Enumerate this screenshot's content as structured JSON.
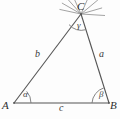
{
  "figure": {
    "kind": "geometry-diagram",
    "background_color": "#fdfdfd",
    "stroke_color": "#555555",
    "vertices": [
      {
        "id": "A",
        "label": "A",
        "x": 14,
        "y": 103
      },
      {
        "id": "B",
        "label": "B",
        "x": 109,
        "y": 103
      },
      {
        "id": "C",
        "label": "C",
        "x": 81,
        "y": 14
      }
    ],
    "sides": [
      {
        "id": "a",
        "label": "a",
        "from": "B",
        "to": "C",
        "label_x": 99,
        "label_y": 49
      },
      {
        "id": "b",
        "label": "b",
        "from": "A",
        "to": "C",
        "label_x": 35,
        "label_y": 49
      },
      {
        "id": "c",
        "label": "c",
        "from": "A",
        "to": "B",
        "label_x": 59,
        "label_y": 103
      }
    ],
    "angles": [
      {
        "id": "alpha",
        "label": "α",
        "at_vertex": "A",
        "arc_radius": 17,
        "label_x": 23,
        "label_y": 90
      },
      {
        "id": "beta",
        "label": "β",
        "at_vertex": "B",
        "arc_radius": 17,
        "label_x": 99,
        "label_y": 90
      },
      {
        "id": "gamma",
        "label": "γ",
        "at_vertex": "C",
        "arc_radius": 16,
        "label_x": 77,
        "label_y": 21
      }
    ],
    "rays_at_C": {
      "name": "radiating-rays",
      "count": 7,
      "origin_x": 81,
      "origin_y": 14,
      "length": 22,
      "angles_deg": [
        168,
        150,
        132,
        114,
        66,
        40,
        16
      ]
    }
  }
}
